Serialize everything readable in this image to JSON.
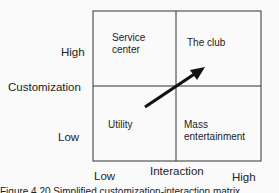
{
  "diagram": {
    "y_axis": {
      "title": "Customization",
      "high": "High",
      "low": "Low"
    },
    "x_axis": {
      "title": "Interaction",
      "low": "Low",
      "high": "High"
    },
    "quadrants": {
      "top_left": "Service center",
      "top_right": "The club",
      "bottom_left": "Utility",
      "bottom_right": "Mass entertainment"
    },
    "arrow": {
      "from": "Utility",
      "to": "The club"
    },
    "caption": "Figure 4.20 Simplified customization-interaction matrix"
  },
  "colors": {
    "line": "#222222",
    "arrow": "#111111",
    "background": "#fafafa"
  }
}
